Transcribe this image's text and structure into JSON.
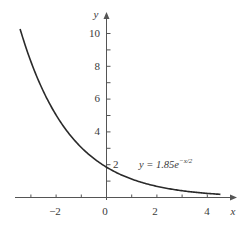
{
  "chart_data": {
    "type": "line",
    "title": "",
    "xlabel": "x",
    "ylabel": "y",
    "xlim": [
      -3.5,
      4.7
    ],
    "ylim": [
      0,
      11
    ],
    "grid": false,
    "x_ticks": [
      -3,
      -2,
      -1,
      0,
      1,
      2,
      3,
      4
    ],
    "x_tick_labels": [
      "-2",
      "0",
      "2",
      "4"
    ],
    "x_tick_label_values": [
      -2,
      0,
      2,
      4
    ],
    "y_ticks": [
      1,
      2,
      3,
      4,
      5,
      6,
      7,
      8,
      9,
      10
    ],
    "y_tick_labels": [
      "2",
      "4",
      "6",
      "8",
      "10"
    ],
    "y_tick_label_values": [
      2,
      4,
      6,
      8,
      10
    ],
    "series": [
      {
        "name": "y = 1.85e^(-x/2)",
        "equation": "y = 1.85e^(-x/2)",
        "x": [
          -3.4,
          -3,
          -2,
          -1,
          0,
          1,
          2,
          3,
          4,
          4.5
        ],
        "values": [
          10.1,
          8.29,
          5.03,
          3.05,
          1.85,
          1.12,
          0.68,
          0.41,
          0.25,
          0.19
        ]
      }
    ],
    "annotations": [
      {
        "text": "y = 1.85e",
        "superscript": "−x/2",
        "x": 1.7,
        "y": 1.85
      }
    ]
  },
  "labels": {
    "x_axis": "x",
    "y_axis": "y",
    "eq_main": "y = 1.85e",
    "eq_sup": "−x/2",
    "x_ticks": [
      "−2",
      "0",
      "2",
      "4"
    ],
    "y_ticks": [
      "2",
      "4",
      "6",
      "8",
      "10"
    ]
  },
  "style": {
    "curve_color": "#2a2a2a",
    "axis_color": "#555555",
    "text_color": "#3a3a3a"
  }
}
